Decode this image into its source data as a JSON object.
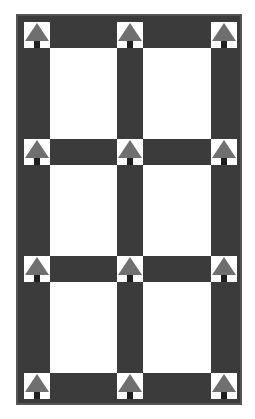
{
  "diagram": {
    "colors": {
      "frame": "#3b3b3b",
      "frame_border": "#555555",
      "pane": "#ffffff",
      "marker_triangle": "#6f6f6f",
      "marker_stem": "#1e1e1e"
    },
    "grid": {
      "columns": 2,
      "rows": 3
    },
    "panes": [
      {
        "id": "r1c1"
      },
      {
        "id": "r1c2"
      },
      {
        "id": "r2c1"
      },
      {
        "id": "r2c2"
      },
      {
        "id": "r3c1"
      },
      {
        "id": "r3c2"
      }
    ],
    "markers": {
      "count": 12,
      "shape": "up-arrow",
      "rows": 4,
      "columns": 3
    }
  }
}
